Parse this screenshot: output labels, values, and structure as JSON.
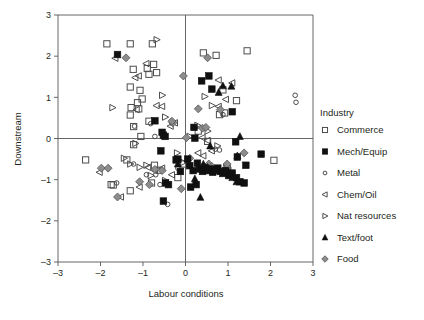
{
  "chart_data": {
    "type": "scatter",
    "title": "",
    "xlabel": "Labour conditions",
    "ylabel": "Downstream",
    "xlim": [
      -3,
      3
    ],
    "ylim": [
      -3,
      3
    ],
    "xticks": [
      "-3",
      "-2",
      "-1",
      "0",
      "1",
      "2",
      "3"
    ],
    "yticks": [
      "-3",
      "-2",
      "-1",
      "0",
      "1",
      "2",
      "3"
    ],
    "grid": false,
    "origin_lines": true,
    "legend": {
      "position": "right",
      "title": "Industry",
      "entries": [
        {
          "label": "Commerce",
          "marker": "open-square",
          "color": "#4d4d4d"
        },
        {
          "label": "Mech/Equip",
          "marker": "filled-square",
          "color": "#101010"
        },
        {
          "label": "Metal",
          "marker": "open-circle",
          "color": "#4d4d4d"
        },
        {
          "label": "Chem/Oil",
          "marker": "open-triangle-left",
          "color": "#4d4d4d"
        },
        {
          "label": "Nat  resources",
          "marker": "open-triangle-right",
          "color": "#4d4d4d"
        },
        {
          "label": "Text/foot",
          "marker": "filled-triangle-up",
          "color": "#101010"
        },
        {
          "label": "Food",
          "marker": "grey-diamond",
          "color": "#8c8c8c"
        }
      ]
    },
    "series": [
      {
        "name": "Commerce",
        "marker": "open-square",
        "points": [
          [
            -1.85,
            2.3
          ],
          [
            -1.3,
            2.3
          ],
          [
            -0.78,
            2.3
          ],
          [
            0.42,
            2.08
          ],
          [
            0.72,
            2.02
          ],
          [
            1.45,
            2.13
          ],
          [
            -1.23,
            1.68
          ],
          [
            -0.75,
            1.8
          ],
          [
            -0.68,
            1.6
          ],
          [
            -0.86,
            1.56
          ],
          [
            -0.9,
            1.7
          ],
          [
            -1.3,
            1.25
          ],
          [
            -1.07,
            1.17
          ],
          [
            -1.13,
            0.87
          ],
          [
            -1.02,
            0.96
          ],
          [
            -1.28,
            0.75
          ],
          [
            -1.3,
            0.57
          ],
          [
            -1.1,
            0.72
          ],
          [
            -1.22,
            0.29
          ],
          [
            -0.86,
            0.42
          ],
          [
            -1.05,
            0.05
          ],
          [
            -1.22,
            -0.15
          ],
          [
            -1.38,
            -0.52
          ],
          [
            -2.35,
            -0.52
          ],
          [
            0.88,
            1.18
          ],
          [
            1.2,
            0.92
          ],
          [
            0.8,
            0.58
          ],
          [
            0.92,
            0.62
          ],
          [
            -1.75,
            -1.12
          ],
          [
            -1.7,
            -1.13
          ],
          [
            -1.3,
            -1.27
          ],
          [
            -0.8,
            -1.08
          ],
          [
            -0.62,
            -0.77
          ],
          [
            -0.73,
            -0.65
          ],
          [
            -0.18,
            -0.95
          ],
          [
            -0.05,
            -0.62
          ],
          [
            0.3,
            0.18
          ],
          [
            0.52,
            -0.07
          ],
          [
            2.08,
            -0.53
          ],
          [
            0.98,
            -0.72
          ]
        ]
      },
      {
        "name": "Mech/Equip",
        "marker": "filled-square",
        "points": [
          [
            -1.6,
            2.04
          ],
          [
            0.55,
            1.52
          ],
          [
            0.38,
            1.4
          ],
          [
            0.62,
            1.2
          ],
          [
            1.1,
            0.65
          ],
          [
            -0.72,
            0.43
          ],
          [
            -0.52,
            0.08
          ],
          [
            -0.55,
            0.15
          ],
          [
            -0.48,
            0.05
          ],
          [
            -0.58,
            -0.3
          ],
          [
            0.2,
            0.27
          ],
          [
            0.22,
            0.01
          ],
          [
            -0.22,
            -0.52
          ],
          [
            -0.18,
            -0.5
          ],
          [
            -0.12,
            -0.8
          ],
          [
            0.05,
            -0.5
          ],
          [
            0.1,
            -0.66
          ],
          [
            0.18,
            -0.78
          ],
          [
            0.28,
            -0.6
          ],
          [
            0.33,
            -0.74
          ],
          [
            0.4,
            -0.8
          ],
          [
            0.46,
            -0.72
          ],
          [
            0.52,
            -0.78
          ],
          [
            0.58,
            -0.74
          ],
          [
            0.64,
            -0.82
          ],
          [
            0.7,
            -0.76
          ],
          [
            0.76,
            -0.72
          ],
          [
            0.82,
            -0.8
          ],
          [
            0.88,
            -0.85
          ],
          [
            0.95,
            -0.78
          ],
          [
            1.02,
            -0.9
          ],
          [
            1.1,
            -0.84
          ],
          [
            1.2,
            -0.95
          ],
          [
            1.28,
            -1.05
          ],
          [
            1.38,
            -1.08
          ],
          [
            1.42,
            -0.65
          ],
          [
            1.78,
            -0.38
          ],
          [
            -0.47,
            -1.08
          ],
          [
            -0.4,
            -1.12
          ],
          [
            -0.52,
            -1.52
          ],
          [
            0.12,
            -1.18
          ],
          [
            0.25,
            -1.12
          ],
          [
            1.22,
            -0.45
          ],
          [
            1.18,
            -0.08
          ]
        ]
      },
      {
        "name": "Metal",
        "marker": "open-circle",
        "points": [
          [
            -1.2,
            0.3
          ],
          [
            -0.82,
            0.36
          ],
          [
            -0.72,
            0.05
          ],
          [
            -0.92,
            -0.88
          ],
          [
            -0.7,
            -0.88
          ],
          [
            -1.22,
            -0.62
          ],
          [
            -0.6,
            -1.12
          ],
          [
            -0.42,
            -1.6
          ],
          [
            0.6,
            -0.7
          ],
          [
            0.7,
            -0.26
          ],
          [
            0.8,
            -0.28
          ],
          [
            0.95,
            -0.65
          ],
          [
            1.02,
            -0.72
          ],
          [
            2.58,
            1.05
          ],
          [
            2.6,
            0.88
          ],
          [
            0.88,
            0.58
          ],
          [
            -0.18,
            -0.72
          ],
          [
            -1.62,
            -1.08
          ]
        ]
      },
      {
        "name": "Chem/Oil",
        "marker": "open-triangle-left",
        "points": [
          [
            -1.65,
            1.95
          ],
          [
            -0.92,
            1.82
          ],
          [
            -1.1,
            1.52
          ],
          [
            -1.18,
            1.48
          ],
          [
            -0.68,
            0.8
          ],
          [
            -0.55,
            0.78
          ],
          [
            0.78,
            1.42
          ],
          [
            1.1,
            1.35
          ],
          [
            0.95,
            0.95
          ],
          [
            0.78,
            0.78
          ],
          [
            -0.35,
            0.3
          ],
          [
            -0.25,
            0.38
          ],
          [
            0.4,
            0.02
          ],
          [
            0.52,
            -0.05
          ],
          [
            0.3,
            -0.35
          ],
          [
            0.42,
            -0.42
          ],
          [
            -0.55,
            -0.72
          ],
          [
            -0.72,
            -0.78
          ],
          [
            -2.02,
            -0.82
          ],
          [
            -1.52,
            -1.42
          ],
          [
            -1.08,
            -1.18
          ],
          [
            -0.88,
            -0.7
          ],
          [
            -0.32,
            -0.88
          ],
          [
            0.62,
            -0.3
          ],
          [
            -1.15,
            0.7
          ]
        ]
      },
      {
        "name": "Nat  resources",
        "marker": "open-triangle-right",
        "points": [
          [
            -0.68,
            2.4
          ],
          [
            -1.72,
            0.75
          ],
          [
            -0.55,
            1.05
          ],
          [
            0.45,
            1.02
          ],
          [
            0.62,
            0.8
          ],
          [
            -0.48,
            0.52
          ],
          [
            -0.3,
            0.4
          ],
          [
            0.52,
            0.18
          ],
          [
            0.1,
            0.05
          ],
          [
            -1.18,
            -0.12
          ],
          [
            -1.45,
            -0.48
          ],
          [
            -1.3,
            -0.62
          ],
          [
            -1.08,
            -0.7
          ],
          [
            -0.92,
            -0.65
          ],
          [
            -0.82,
            -0.9
          ],
          [
            -0.05,
            -0.58
          ],
          [
            -0.48,
            -1.02
          ],
          [
            -0.2,
            -0.35
          ],
          [
            0.28,
            0.32
          ],
          [
            0.75,
            -0.18
          ]
        ]
      },
      {
        "name": "Text/foot",
        "marker": "filled-triangle-up",
        "points": [
          [
            0.88,
            1.28
          ],
          [
            1.08,
            1.27
          ],
          [
            0.78,
            1.12
          ],
          [
            0.58,
            -0.18
          ],
          [
            0.42,
            -0.62
          ],
          [
            0.52,
            -0.7
          ],
          [
            0.72,
            -0.78
          ],
          [
            0.95,
            -0.8
          ],
          [
            1.1,
            -0.95
          ],
          [
            1.2,
            -1.05
          ],
          [
            1.28,
            0.05
          ],
          [
            1.22,
            -0.42
          ],
          [
            0.35,
            -1.43
          ],
          [
            0.22,
            -0.98
          ],
          [
            -0.18,
            -0.62
          ]
        ]
      },
      {
        "name": "Food",
        "marker": "grey-diamond",
        "points": [
          [
            -1.4,
            1.96
          ],
          [
            0.52,
            1.96
          ],
          [
            -0.05,
            1.52
          ],
          [
            0.3,
            0.72
          ],
          [
            0.82,
            0.7
          ],
          [
            0.4,
            0.25
          ],
          [
            0.48,
            0.27
          ],
          [
            -0.3,
            0.38
          ],
          [
            -0.32,
            0.42
          ],
          [
            0.02,
            0.02
          ],
          [
            0.1,
            -0.48
          ],
          [
            0.55,
            -0.62
          ],
          [
            0.62,
            -0.68
          ],
          [
            1.38,
            -0.35
          ],
          [
            -1.98,
            -0.72
          ],
          [
            -1.82,
            -0.72
          ],
          [
            -1.6,
            -1.42
          ],
          [
            -1.08,
            -1.05
          ],
          [
            -0.72,
            -0.75
          ],
          [
            -0.55,
            -0.78
          ],
          [
            -0.1,
            -1.22
          ],
          [
            0.48,
            -0.72
          ],
          [
            0.98,
            -0.62
          ],
          [
            -0.85,
            -1.12
          ]
        ]
      }
    ]
  }
}
